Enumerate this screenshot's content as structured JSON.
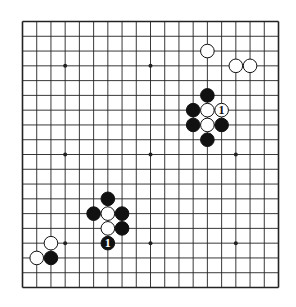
{
  "diagram": {
    "type": "go-board",
    "size": 19,
    "colors": {
      "line": "#222222",
      "black_stone": "#111111",
      "white_stone": "#ffffff",
      "background": "#ffffff"
    },
    "star_points": [
      [
        3,
        3
      ],
      [
        9,
        3
      ],
      [
        15,
        3
      ],
      [
        3,
        9
      ],
      [
        9,
        9
      ],
      [
        15,
        9
      ],
      [
        3,
        15
      ],
      [
        9,
        15
      ],
      [
        15,
        15
      ]
    ],
    "stones": [
      {
        "color": "white",
        "col": 13,
        "row": 2
      },
      {
        "color": "white",
        "col": 15,
        "row": 3
      },
      {
        "color": "white",
        "col": 16,
        "row": 3
      },
      {
        "color": "black",
        "col": 13,
        "row": 5
      },
      {
        "color": "black",
        "col": 12,
        "row": 6
      },
      {
        "color": "white",
        "col": 13,
        "row": 6
      },
      {
        "color": "white",
        "col": 14,
        "row": 6,
        "label": "1"
      },
      {
        "color": "black",
        "col": 12,
        "row": 7
      },
      {
        "color": "white",
        "col": 13,
        "row": 7
      },
      {
        "color": "black",
        "col": 14,
        "row": 7
      },
      {
        "color": "black",
        "col": 13,
        "row": 8
      },
      {
        "color": "black",
        "col": 6,
        "row": 12
      },
      {
        "color": "black",
        "col": 5,
        "row": 13
      },
      {
        "color": "white",
        "col": 6,
        "row": 13
      },
      {
        "color": "black",
        "col": 7,
        "row": 13
      },
      {
        "color": "white",
        "col": 6,
        "row": 14
      },
      {
        "color": "black",
        "col": 7,
        "row": 14
      },
      {
        "color": "black",
        "col": 6,
        "row": 15,
        "label": "1"
      },
      {
        "color": "white",
        "col": 2,
        "row": 15
      },
      {
        "color": "white",
        "col": 1,
        "row": 16
      },
      {
        "color": "black",
        "col": 2,
        "row": 16
      }
    ]
  }
}
